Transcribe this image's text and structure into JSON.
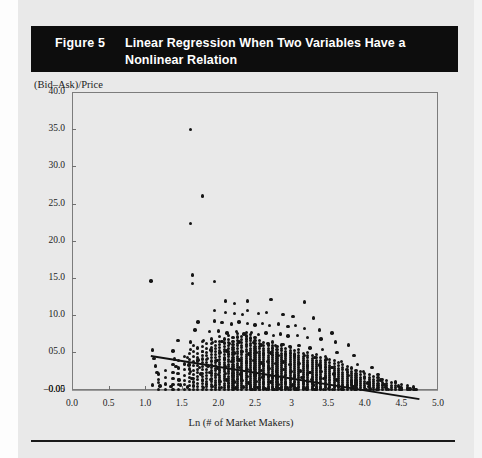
{
  "header": {
    "figure_number": "Figure 5",
    "title": "Linear Regression When Two Variables Have a Nonlinear Relation",
    "background_color": "#0d0d0d",
    "text_color": "#ffffff"
  },
  "chart_data": {
    "type": "scatter",
    "title": "Linear Regression When Two Variables Have a Nonlinear Relation",
    "xlabel": "Ln (# of Market Makers)",
    "ylabel": "(Bid–Ask)/Price",
    "xlim": [
      0.0,
      5.0
    ],
    "ylim": [
      -0.05,
      40.0
    ],
    "grid": false,
    "legend": null,
    "xticks": [
      0.0,
      0.5,
      1.0,
      1.5,
      2.0,
      2.5,
      3.0,
      3.5,
      4.0,
      4.5,
      5.0
    ],
    "xtick_labels": [
      "0.0",
      "0.5",
      "1.0",
      "1.5",
      "2.0",
      "2.5",
      "3",
      "3.5",
      "4.0",
      "4.5",
      "5.0"
    ],
    "yticks": [
      -0.05,
      0.0,
      5.0,
      10.0,
      15.0,
      20.0,
      25.0,
      30.0,
      35.0,
      40.0
    ],
    "ytick_labels": [
      "–0.05",
      "0.00",
      "05.0",
      "10.0",
      "15.0",
      "20.0",
      "25.0",
      "30.0",
      "35.0",
      "40.0"
    ],
    "marker_color": "#151515",
    "zero_line_y": 0.0,
    "fit_line": {
      "type": "linear",
      "x_start": 1.08,
      "y_start": 4.6,
      "x_end": 4.75,
      "y_end": -1.2,
      "color": "#111111"
    },
    "points": [
      [
        1.62,
        35.0
      ],
      [
        1.78,
        26.0
      ],
      [
        1.62,
        22.3
      ],
      [
        1.08,
        14.6
      ],
      [
        1.65,
        15.4
      ],
      [
        1.65,
        14.3
      ],
      [
        1.95,
        14.5
      ],
      [
        2.1,
        11.9
      ],
      [
        2.22,
        11.6
      ],
      [
        2.4,
        11.9
      ],
      [
        2.72,
        12.1
      ],
      [
        3.18,
        11.8
      ],
      [
        1.95,
        10.6
      ],
      [
        2.1,
        10.4
      ],
      [
        2.22,
        10.2
      ],
      [
        2.33,
        10.1
      ],
      [
        2.4,
        10.6
      ],
      [
        2.55,
        10.2
      ],
      [
        2.66,
        10.4
      ],
      [
        2.88,
        10.1
      ],
      [
        3.02,
        9.8
      ],
      [
        3.3,
        9.6
      ],
      [
        1.72,
        9.1
      ],
      [
        1.95,
        9.2
      ],
      [
        2.05,
        9.0
      ],
      [
        2.18,
        8.8
      ],
      [
        2.28,
        9.1
      ],
      [
        2.4,
        8.9
      ],
      [
        2.5,
        8.7
      ],
      [
        2.6,
        8.9
      ],
      [
        2.7,
        8.6
      ],
      [
        2.82,
        8.8
      ],
      [
        2.95,
        8.5
      ],
      [
        3.05,
        8.6
      ],
      [
        3.18,
        8.2
      ],
      [
        3.38,
        8.0
      ],
      [
        3.55,
        7.6
      ],
      [
        1.68,
        8.0
      ],
      [
        1.88,
        7.8
      ],
      [
        2.0,
        7.9
      ],
      [
        2.12,
        7.6
      ],
      [
        2.25,
        7.8
      ],
      [
        2.35,
        7.5
      ],
      [
        2.45,
        7.7
      ],
      [
        2.55,
        7.4
      ],
      [
        2.65,
        7.6
      ],
      [
        2.75,
        7.3
      ],
      [
        2.85,
        7.5
      ],
      [
        2.95,
        7.2
      ],
      [
        3.08,
        7.3
      ],
      [
        3.22,
        7.0
      ],
      [
        3.4,
        6.8
      ],
      [
        3.6,
        6.4
      ],
      [
        3.78,
        6.0
      ],
      [
        1.45,
        6.6
      ],
      [
        1.62,
        6.4
      ],
      [
        1.8,
        6.6
      ],
      [
        1.92,
        6.3
      ],
      [
        2.05,
        6.5
      ],
      [
        2.15,
        6.2
      ],
      [
        2.28,
        6.4
      ],
      [
        2.38,
        6.1
      ],
      [
        2.48,
        6.3
      ],
      [
        2.58,
        6.0
      ],
      [
        2.68,
        6.2
      ],
      [
        2.78,
        5.9
      ],
      [
        2.88,
        6.1
      ],
      [
        2.98,
        5.8
      ],
      [
        3.1,
        5.9
      ],
      [
        3.25,
        5.6
      ],
      [
        3.42,
        5.4
      ],
      [
        3.62,
        5.0
      ],
      [
        3.85,
        4.6
      ],
      [
        1.1,
        5.3
      ],
      [
        1.38,
        5.2
      ],
      [
        1.62,
        5.4
      ],
      [
        1.78,
        5.1
      ],
      [
        1.9,
        5.3
      ],
      [
        2.02,
        5.0
      ],
      [
        2.12,
        5.2
      ],
      [
        2.22,
        4.9
      ],
      [
        2.32,
        5.1
      ],
      [
        2.42,
        4.8
      ],
      [
        2.52,
        5.0
      ],
      [
        2.62,
        4.7
      ],
      [
        2.72,
        4.9
      ],
      [
        2.82,
        4.6
      ],
      [
        2.92,
        4.8
      ],
      [
        3.04,
        4.5
      ],
      [
        3.18,
        4.6
      ],
      [
        3.32,
        4.3
      ],
      [
        3.48,
        4.1
      ],
      [
        3.68,
        3.8
      ],
      [
        3.9,
        3.4
      ],
      [
        4.1,
        3.0
      ],
      [
        1.12,
        4.2
      ],
      [
        1.4,
        4.1
      ],
      [
        1.58,
        4.3
      ],
      [
        1.72,
        4.0
      ],
      [
        1.85,
        4.2
      ],
      [
        1.98,
        3.9
      ],
      [
        2.08,
        4.1
      ],
      [
        2.18,
        3.8
      ],
      [
        2.28,
        4.0
      ],
      [
        2.38,
        3.7
      ],
      [
        2.48,
        3.9
      ],
      [
        2.58,
        3.6
      ],
      [
        2.68,
        3.8
      ],
      [
        2.78,
        3.5
      ],
      [
        2.88,
        3.7
      ],
      [
        2.98,
        3.4
      ],
      [
        3.1,
        3.5
      ],
      [
        3.22,
        3.2
      ],
      [
        3.38,
        3.3
      ],
      [
        3.55,
        3.0
      ],
      [
        3.75,
        2.7
      ],
      [
        3.98,
        2.4
      ],
      [
        4.18,
        2.0
      ],
      [
        1.14,
        3.2
      ],
      [
        1.42,
        3.1
      ],
      [
        1.6,
        3.3
      ],
      [
        1.74,
        3.0
      ],
      [
        1.86,
        3.2
      ],
      [
        1.99,
        2.9
      ],
      [
        2.09,
        3.1
      ],
      [
        2.19,
        2.8
      ],
      [
        2.29,
        3.0
      ],
      [
        2.39,
        2.7
      ],
      [
        2.49,
        2.9
      ],
      [
        2.59,
        2.6
      ],
      [
        2.69,
        2.8
      ],
      [
        2.79,
        2.5
      ],
      [
        2.89,
        2.7
      ],
      [
        2.99,
        2.4
      ],
      [
        3.12,
        2.5
      ],
      [
        3.25,
        2.3
      ],
      [
        3.4,
        2.4
      ],
      [
        3.58,
        2.1
      ],
      [
        3.78,
        1.9
      ],
      [
        4.0,
        1.6
      ],
      [
        4.22,
        1.3
      ],
      [
        4.42,
        1.0
      ],
      [
        1.16,
        2.3
      ],
      [
        1.44,
        2.2
      ],
      [
        1.62,
        2.4
      ],
      [
        1.76,
        2.1
      ],
      [
        1.88,
        2.3
      ],
      [
        2.0,
        2.0
      ],
      [
        2.1,
        2.2
      ],
      [
        2.2,
        1.9
      ],
      [
        2.3,
        2.1
      ],
      [
        2.4,
        1.8
      ],
      [
        2.5,
        2.0
      ],
      [
        2.6,
        1.7
      ],
      [
        2.7,
        1.9
      ],
      [
        2.8,
        1.6
      ],
      [
        2.9,
        1.8
      ],
      [
        3.0,
        1.5
      ],
      [
        3.14,
        1.6
      ],
      [
        3.28,
        1.4
      ],
      [
        3.44,
        1.5
      ],
      [
        3.62,
        1.3
      ],
      [
        3.82,
        1.1
      ],
      [
        4.04,
        0.9
      ],
      [
        4.26,
        0.7
      ],
      [
        4.46,
        0.5
      ],
      [
        1.18,
        1.4
      ],
      [
        1.46,
        1.3
      ],
      [
        1.64,
        1.5
      ],
      [
        1.78,
        1.2
      ],
      [
        1.9,
        1.4
      ],
      [
        2.02,
        1.1
      ],
      [
        2.12,
        1.3
      ],
      [
        2.22,
        1.0
      ],
      [
        2.32,
        1.2
      ],
      [
        2.42,
        0.9
      ],
      [
        2.52,
        1.1
      ],
      [
        2.62,
        0.8
      ],
      [
        2.72,
        1.0
      ],
      [
        2.82,
        0.7
      ],
      [
        2.92,
        0.9
      ],
      [
        3.02,
        0.6
      ],
      [
        3.16,
        0.8
      ],
      [
        3.3,
        0.6
      ],
      [
        3.46,
        0.7
      ],
      [
        3.64,
        0.5
      ],
      [
        3.84,
        0.45
      ],
      [
        4.06,
        0.4
      ],
      [
        4.28,
        0.35
      ],
      [
        4.48,
        0.3
      ],
      [
        1.1,
        0.6
      ],
      [
        1.2,
        0.5
      ],
      [
        1.35,
        0.4
      ],
      [
        1.48,
        0.6
      ],
      [
        1.58,
        0.35
      ],
      [
        1.66,
        0.5
      ],
      [
        1.8,
        0.3
      ],
      [
        1.92,
        0.45
      ],
      [
        2.04,
        0.25
      ],
      [
        2.14,
        0.4
      ],
      [
        2.24,
        0.2
      ],
      [
        2.34,
        0.35
      ],
      [
        2.44,
        0.18
      ],
      [
        2.54,
        0.3
      ],
      [
        2.64,
        0.15
      ],
      [
        2.74,
        0.28
      ],
      [
        2.84,
        0.12
      ],
      [
        2.94,
        0.25
      ],
      [
        3.06,
        0.1
      ],
      [
        3.2,
        0.2
      ],
      [
        3.34,
        0.1
      ],
      [
        3.5,
        0.18
      ],
      [
        3.68,
        0.08
      ],
      [
        3.88,
        0.15
      ],
      [
        4.08,
        0.08
      ],
      [
        4.3,
        0.12
      ],
      [
        4.5,
        0.06
      ],
      [
        4.62,
        0.1
      ],
      [
        4.7,
        0.05
      ],
      [
        2.46,
        0.05
      ],
      [
        2.56,
        0.05
      ],
      [
        2.66,
        0.05
      ],
      [
        2.76,
        0.05
      ],
      [
        2.86,
        0.05
      ],
      [
        2.96,
        0.05
      ],
      [
        3.08,
        0.05
      ],
      [
        3.2,
        0.05
      ],
      [
        3.32,
        0.05
      ],
      [
        3.44,
        0.05
      ],
      [
        3.56,
        0.05
      ],
      [
        3.7,
        0.05
      ],
      [
        3.86,
        0.05
      ],
      [
        4.02,
        0.05
      ],
      [
        4.16,
        0.05
      ],
      [
        4.32,
        0.05
      ],
      [
        4.48,
        0.05
      ],
      [
        4.6,
        0.05
      ],
      [
        4.68,
        0.05
      ]
    ],
    "dense_bands": [
      {
        "x": 2.5,
        "y_top": 7.0,
        "count": 26
      },
      {
        "x": 2.56,
        "y_top": 6.6,
        "count": 25
      },
      {
        "x": 2.62,
        "y_top": 6.3,
        "count": 25
      },
      {
        "x": 2.68,
        "y_top": 6.0,
        "count": 24
      },
      {
        "x": 2.74,
        "y_top": 6.4,
        "count": 24
      },
      {
        "x": 2.8,
        "y_top": 5.8,
        "count": 23
      },
      {
        "x": 2.86,
        "y_top": 6.0,
        "count": 23
      },
      {
        "x": 2.92,
        "y_top": 5.5,
        "count": 22
      },
      {
        "x": 2.98,
        "y_top": 5.7,
        "count": 22
      },
      {
        "x": 3.04,
        "y_top": 5.2,
        "count": 21
      },
      {
        "x": 3.1,
        "y_top": 5.4,
        "count": 21
      },
      {
        "x": 3.16,
        "y_top": 4.9,
        "count": 20
      },
      {
        "x": 3.22,
        "y_top": 5.0,
        "count": 20
      },
      {
        "x": 3.28,
        "y_top": 4.6,
        "count": 19
      },
      {
        "x": 3.34,
        "y_top": 4.7,
        "count": 19
      },
      {
        "x": 3.4,
        "y_top": 4.3,
        "count": 18
      },
      {
        "x": 3.46,
        "y_top": 4.4,
        "count": 17
      },
      {
        "x": 3.52,
        "y_top": 4.0,
        "count": 16
      },
      {
        "x": 3.58,
        "y_top": 3.9,
        "count": 15
      },
      {
        "x": 3.64,
        "y_top": 3.6,
        "count": 14
      },
      {
        "x": 3.7,
        "y_top": 3.4,
        "count": 13
      },
      {
        "x": 3.76,
        "y_top": 3.1,
        "count": 12
      },
      {
        "x": 3.82,
        "y_top": 2.9,
        "count": 11
      },
      {
        "x": 3.88,
        "y_top": 2.6,
        "count": 10
      },
      {
        "x": 3.94,
        "y_top": 2.4,
        "count": 9
      },
      {
        "x": 4.0,
        "y_top": 2.2,
        "count": 8
      },
      {
        "x": 4.06,
        "y_top": 2.0,
        "count": 8
      },
      {
        "x": 4.12,
        "y_top": 1.8,
        "count": 7
      },
      {
        "x": 4.18,
        "y_top": 1.6,
        "count": 6
      },
      {
        "x": 4.24,
        "y_top": 1.4,
        "count": 5
      },
      {
        "x": 4.3,
        "y_top": 1.2,
        "count": 5
      },
      {
        "x": 4.36,
        "y_top": 1.0,
        "count": 4
      },
      {
        "x": 4.42,
        "y_top": 0.9,
        "count": 4
      },
      {
        "x": 4.5,
        "y_top": 0.7,
        "count": 3
      },
      {
        "x": 4.58,
        "y_top": 0.5,
        "count": 3
      },
      {
        "x": 4.66,
        "y_top": 0.35,
        "count": 2
      },
      {
        "x": 2.44,
        "y_top": 7.4,
        "count": 27
      },
      {
        "x": 2.38,
        "y_top": 7.7,
        "count": 26
      },
      {
        "x": 2.32,
        "y_top": 7.2,
        "count": 25
      },
      {
        "x": 2.26,
        "y_top": 7.6,
        "count": 24
      },
      {
        "x": 2.2,
        "y_top": 7.0,
        "count": 23
      },
      {
        "x": 2.14,
        "y_top": 7.3,
        "count": 22
      },
      {
        "x": 2.08,
        "y_top": 6.8,
        "count": 21
      },
      {
        "x": 2.02,
        "y_top": 7.1,
        "count": 20
      },
      {
        "x": 1.96,
        "y_top": 6.5,
        "count": 19
      },
      {
        "x": 1.9,
        "y_top": 6.8,
        "count": 17
      },
      {
        "x": 1.84,
        "y_top": 6.2,
        "count": 15
      },
      {
        "x": 1.78,
        "y_top": 6.5,
        "count": 14
      },
      {
        "x": 1.72,
        "y_top": 5.6,
        "count": 12
      },
      {
        "x": 1.66,
        "y_top": 5.9,
        "count": 11
      },
      {
        "x": 1.6,
        "y_top": 4.9,
        "count": 9
      },
      {
        "x": 1.54,
        "y_top": 4.4,
        "count": 7
      },
      {
        "x": 1.46,
        "y_top": 3.9,
        "count": 6
      },
      {
        "x": 1.38,
        "y_top": 3.4,
        "count": 5
      },
      {
        "x": 1.28,
        "y_top": 2.6,
        "count": 4
      },
      {
        "x": 1.18,
        "y_top": 2.1,
        "count": 3
      }
    ]
  }
}
